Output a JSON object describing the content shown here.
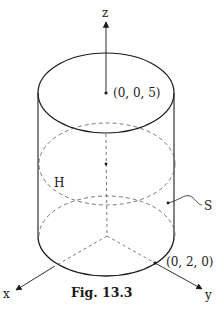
{
  "figure": {
    "caption": "Fig. 13.3",
    "axes": {
      "x_label": "x",
      "y_label": "y",
      "z_label": "z"
    },
    "points": {
      "top_center_label": "(0, 0, 5)",
      "y_axis_point_label": "(0, 2, 0)"
    },
    "regions": {
      "hemisphere_label": "H",
      "surface_label": "S"
    },
    "colors": {
      "stroke": "#1a1a1a",
      "dashed": "#555555",
      "background": "#ffffff"
    }
  }
}
